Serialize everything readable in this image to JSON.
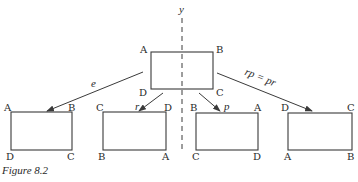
{
  "figure": {
    "caption": "Figure 8.2",
    "axis_label": "y",
    "center_rect": {
      "tl": "A",
      "tr": "B",
      "bl": "D",
      "br": "C"
    },
    "arrows": [
      {
        "label": "e"
      },
      {
        "label": "r"
      },
      {
        "label": "p"
      },
      {
        "label": "rp = pr"
      }
    ],
    "results": [
      {
        "name": "e",
        "tl": "A",
        "tr": "B",
        "bl": "D",
        "br": "C"
      },
      {
        "name": "r",
        "tl": "C",
        "tr": "D",
        "bl": "B",
        "br": "A"
      },
      {
        "name": "p",
        "tl": "B",
        "tr": "A",
        "bl": "C",
        "br": "D"
      },
      {
        "name": "rp",
        "tl": "D",
        "tr": "C",
        "bl": "A",
        "br": "B"
      }
    ]
  }
}
